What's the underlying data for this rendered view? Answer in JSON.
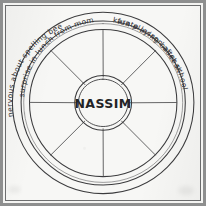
{
  "diagram": {
    "title": "NASSIM",
    "hub_label": "NASSIM",
    "type": "wheel",
    "spoke_count": 8,
    "segment_count": 8,
    "ink_color": "#3b3b3d",
    "paper_color": "#f7f7f5",
    "frame_color": "#8e8f8f",
    "ring_entries": [
      {
        "id": "top-left",
        "text": "nervous about spelling bee",
        "orientation": "upright"
      },
      {
        "id": "top-right",
        "text": "fun playing baseball",
        "orientation": "upright"
      },
      {
        "id": "bottom-right",
        "text": "karate lesson after school",
        "orientation": "inverted"
      },
      {
        "id": "bottom-left",
        "text": "surprise in lunch from mom",
        "orientation": "inverted"
      }
    ]
  }
}
